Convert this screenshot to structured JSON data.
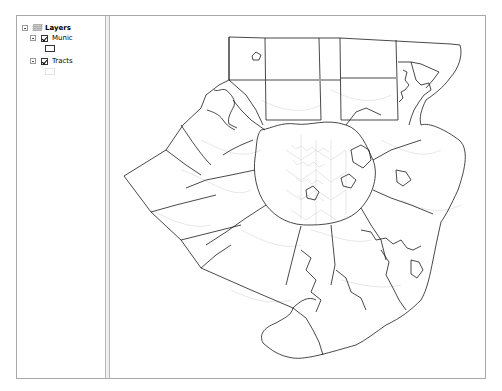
{
  "toc": {
    "root": {
      "label": "Layers",
      "icon": "layers-icon",
      "expanded": true
    },
    "layers": [
      {
        "name": "Munic",
        "checked": true,
        "expanded": true,
        "symbol": {
          "fill": "#ffffff",
          "outline": "#333333"
        }
      },
      {
        "name": "Tracts",
        "checked": true,
        "expanded": true,
        "symbol": {
          "fill": "#ffffff",
          "outline": "#dcdcdc"
        }
      }
    ]
  },
  "map": {
    "munic_outline_color": "#1a1a1a",
    "tracts_outline_color": "#d4d4d4"
  }
}
